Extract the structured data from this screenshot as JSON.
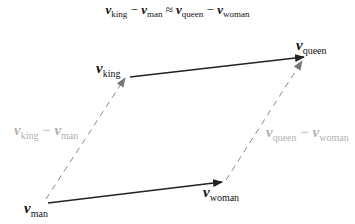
{
  "equation": {
    "v1": "v",
    "s1": "king",
    "op1": "−",
    "v2": "v",
    "s2": "man",
    "op2": "≈",
    "v3": "v",
    "s3": "queen",
    "op3": "−",
    "v4": "v",
    "s4": "woman"
  },
  "labels": {
    "king": {
      "v": "v",
      "sub": "king"
    },
    "queen": {
      "v": "v",
      "sub": "queen"
    },
    "man": {
      "v": "v",
      "sub": "man"
    },
    "woman": {
      "v": "v",
      "sub": "woman"
    },
    "diff_left": {
      "v1": "v",
      "s1": "king",
      "op": "−",
      "v2": "v",
      "s2": "man"
    },
    "diff_right": {
      "v1": "v",
      "s1": "queen",
      "op": "−",
      "v2": "v",
      "s2": "woman"
    }
  },
  "colors": {
    "solid": "#222222",
    "dashed": "#888888",
    "diff_label": "#b0b0b0"
  }
}
